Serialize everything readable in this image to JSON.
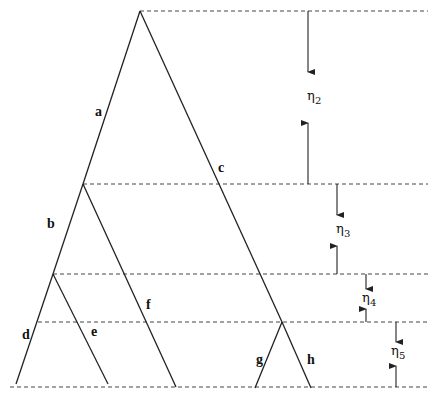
{
  "diagram": {
    "type": "coalescent-tree",
    "colors": {
      "line": "#222222",
      "dashed": "#444444",
      "background": "#ffffff"
    },
    "levels": [
      {
        "id": "level-1",
        "y": 11
      },
      {
        "id": "level-2",
        "y": 184
      },
      {
        "id": "level-3",
        "y": 274
      },
      {
        "id": "level-4",
        "y": 322
      },
      {
        "id": "level-5",
        "y": 387
      }
    ],
    "branches": [
      {
        "label": "a",
        "from": [
          140,
          11
        ],
        "to": [
          83,
          184
        ]
      },
      {
        "label": "c",
        "from": [
          140,
          11
        ],
        "to": [
          282,
          322
        ]
      },
      {
        "label": "b",
        "from": [
          83,
          184
        ],
        "to": [
          53,
          274
        ]
      },
      {
        "label": "f",
        "from": [
          83,
          184
        ],
        "to": [
          176,
          387
        ]
      },
      {
        "label": "d",
        "from": [
          53,
          274
        ],
        "to": [
          16,
          384
        ]
      },
      {
        "label": "e",
        "from": [
          53,
          274
        ],
        "to": [
          108,
          384
        ]
      },
      {
        "label": "g",
        "from": [
          282,
          322
        ],
        "to": [
          255,
          388
        ]
      },
      {
        "label": "h",
        "from": [
          282,
          322
        ],
        "to": [
          311,
          388
        ]
      }
    ],
    "branch_labels": {
      "a": "a",
      "b": "b",
      "c": "c",
      "d": "d",
      "e": "e",
      "f": "f",
      "g": "g",
      "h": "h"
    },
    "intervals": [
      {
        "symbol": "η",
        "subscript": "2",
        "top": 11,
        "bottom": 184,
        "x": 308
      },
      {
        "symbol": "η",
        "subscript": "3",
        "top": 184,
        "bottom": 274,
        "x": 337
      },
      {
        "symbol": "η",
        "subscript": "4",
        "top": 274,
        "bottom": 322,
        "x": 366
      },
      {
        "symbol": "η",
        "subscript": "5",
        "top": 322,
        "bottom": 387,
        "x": 396
      }
    ]
  }
}
